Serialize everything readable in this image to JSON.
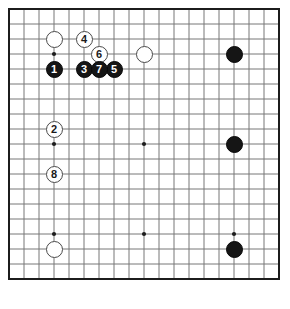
{
  "diagram": {
    "board_size": 19,
    "background_color": "#ffffff",
    "border_color": "#1c1c1c",
    "grid_color": "#777777",
    "black_color": "#151515",
    "white_color": "#ffffff",
    "geometry": {
      "origin_x": 9,
      "origin_y": 9,
      "spacing": 15,
      "stone_radius": 8.5,
      "border_width": 2
    }
  },
  "star_points": [
    {
      "name": "hoshi-left-top",
      "col": 3,
      "row": 3
    },
    {
      "name": "hoshi-center-top",
      "col": 9,
      "row": 3
    },
    {
      "name": "hoshi-right-top",
      "col": 15,
      "row": 3
    },
    {
      "name": "hoshi-left-middle",
      "col": 3,
      "row": 9
    },
    {
      "name": "hoshi-tengen",
      "col": 9,
      "row": 9
    },
    {
      "name": "hoshi-right-middle",
      "col": 15,
      "row": 9
    },
    {
      "name": "hoshi-left-bottom",
      "col": 3,
      "row": 15
    },
    {
      "name": "hoshi-center-bottom",
      "col": 9,
      "row": 15
    },
    {
      "name": "hoshi-right-bottom",
      "col": 15,
      "row": 15
    }
  ],
  "stones": [
    {
      "id": "stone-white-d16",
      "color": "white",
      "col": 3,
      "row": 2,
      "label": ""
    },
    {
      "id": "stone-white-k16",
      "color": "white",
      "col": 9,
      "row": 3,
      "label": ""
    },
    {
      "id": "stone-black-q16",
      "color": "black",
      "col": 15,
      "row": 3,
      "label": ""
    },
    {
      "id": "stone-black-q10",
      "color": "black",
      "col": 15,
      "row": 9,
      "label": ""
    },
    {
      "id": "stone-black-q4",
      "color": "black",
      "col": 15,
      "row": 16,
      "label": ""
    },
    {
      "id": "stone-white-d4",
      "color": "white",
      "col": 3,
      "row": 16,
      "label": ""
    },
    {
      "id": "stone-move-1",
      "color": "black",
      "col": 3,
      "row": 4,
      "label": "1"
    },
    {
      "id": "stone-move-2",
      "color": "white",
      "col": 3,
      "row": 8,
      "label": "2"
    },
    {
      "id": "stone-move-3",
      "color": "black",
      "col": 5,
      "row": 4,
      "label": "3"
    },
    {
      "id": "stone-move-4",
      "color": "white",
      "col": 5,
      "row": 2,
      "label": "4"
    },
    {
      "id": "stone-move-5",
      "color": "black",
      "col": 7,
      "row": 4,
      "label": "5"
    },
    {
      "id": "stone-move-6",
      "color": "white",
      "col": 6,
      "row": 3,
      "label": "6"
    },
    {
      "id": "stone-move-7",
      "color": "black",
      "col": 6,
      "row": 4,
      "label": "7"
    },
    {
      "id": "stone-move-8",
      "color": "white",
      "col": 3,
      "row": 11,
      "label": "8"
    }
  ]
}
